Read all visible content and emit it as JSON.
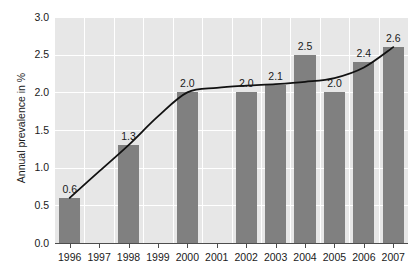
{
  "chart_data": {
    "type": "bar",
    "title": "",
    "subtitle": "",
    "xlabel": "",
    "ylabel": "Annual prevalence in %",
    "categories": [
      "1996",
      "1997",
      "1998",
      "1999",
      "2000",
      "2001",
      "2002",
      "2003",
      "2004",
      "2005",
      "2006",
      "2007"
    ],
    "values": [
      0.6,
      null,
      1.3,
      null,
      2.0,
      null,
      2.0,
      2.1,
      2.5,
      2.0,
      2.4,
      2.6
    ],
    "data_labels": [
      "0.6",
      "",
      "1.3",
      "",
      "2.0",
      "",
      "2.0",
      "2.1",
      "2.5",
      "2.0",
      "2.4",
      "2.6"
    ],
    "ylim": [
      0.0,
      3.0
    ],
    "ytick_values": [
      0.0,
      0.5,
      1.0,
      1.5,
      2.0,
      2.5,
      3.0
    ],
    "ytick_labels": [
      "0.0",
      "0.5",
      "1.0",
      "1.5",
      "2.0",
      "2.5",
      "3.0"
    ],
    "grid": true,
    "legend": "none",
    "series": [
      {
        "name": "Annual prevalence",
        "type": "bar",
        "values": [
          0.6,
          null,
          1.3,
          null,
          2.0,
          null,
          2.0,
          2.1,
          2.5,
          2.0,
          2.4,
          2.6
        ]
      },
      {
        "name": "Trend line",
        "type": "line",
        "values": [
          0.6,
          0.95,
          1.3,
          1.68,
          2.0,
          2.06,
          2.09,
          2.11,
          2.14,
          2.19,
          2.33,
          2.6
        ]
      }
    ],
    "colors": {
      "bar": "#808080",
      "trend_line": "#111111",
      "plot_background": "#e7e7e7",
      "gridline": "#ffffff",
      "axis": "#4d4d4d",
      "text": "#1a1a1a",
      "page_background": "#ffffff"
    }
  }
}
